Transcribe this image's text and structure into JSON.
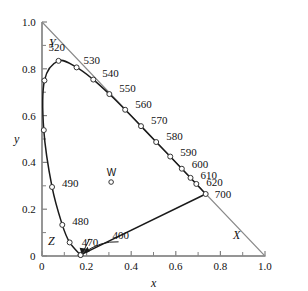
{
  "chart_data": {
    "type": "scatter",
    "title": "",
    "subtitle": "",
    "xlabel": "x",
    "ylabel": "y",
    "xlim": [
      0,
      1.0
    ],
    "ylim": [
      0,
      1.0
    ],
    "grid": false,
    "legend": null,
    "x_ticks": [
      "0",
      "0.2",
      "0.4",
      "0.6",
      "0.8",
      "1.0"
    ],
    "x_tick_values": [
      0,
      0.2,
      0.4,
      0.6,
      0.8,
      1.0
    ],
    "x_minor_tick_values": [
      0.1,
      0.3,
      0.5,
      0.7,
      0.9
    ],
    "y_ticks": [
      "0",
      "0.2",
      "0.4",
      "0.6",
      "0.8",
      "1.0"
    ],
    "y_tick_values": [
      0,
      0.2,
      0.4,
      0.6,
      0.8,
      1.0
    ],
    "y_minor_tick_values": [
      0.1,
      0.3,
      0.5,
      0.7,
      0.9
    ],
    "series": [
      {
        "name": "spectral-locus",
        "kind": "curve-with-markers",
        "points": [
          {
            "label": "400",
            "x": 0.173,
            "y": 0.005,
            "labeled": true,
            "arrow": true
          },
          {
            "label": "",
            "x": 0.173,
            "y": 0.004,
            "labeled": false
          },
          {
            "label": "470",
            "x": 0.124,
            "y": 0.058,
            "labeled": true,
            "arrow": true
          },
          {
            "label": "480",
            "x": 0.091,
            "y": 0.133,
            "labeled": true
          },
          {
            "label": "490",
            "x": 0.045,
            "y": 0.295,
            "labeled": true
          },
          {
            "label": "",
            "x": 0.008,
            "y": 0.538,
            "labeled": false
          },
          {
            "label": "",
            "x": 0.011,
            "y": 0.75,
            "labeled": false
          },
          {
            "label": "520",
            "x": 0.074,
            "y": 0.834,
            "labeled": true
          },
          {
            "label": "530",
            "x": 0.155,
            "y": 0.806,
            "labeled": true
          },
          {
            "label": "540",
            "x": 0.23,
            "y": 0.754,
            "labeled": true
          },
          {
            "label": "550",
            "x": 0.302,
            "y": 0.692,
            "labeled": true
          },
          {
            "label": "560",
            "x": 0.373,
            "y": 0.625,
            "labeled": true
          },
          {
            "label": "570",
            "x": 0.444,
            "y": 0.555,
            "labeled": true
          },
          {
            "label": "580",
            "x": 0.512,
            "y": 0.487,
            "labeled": true
          },
          {
            "label": "590",
            "x": 0.575,
            "y": 0.425,
            "labeled": true
          },
          {
            "label": "600",
            "x": 0.627,
            "y": 0.373,
            "labeled": true
          },
          {
            "label": "610",
            "x": 0.666,
            "y": 0.334,
            "labeled": true
          },
          {
            "label": "620",
            "x": 0.692,
            "y": 0.308,
            "labeled": true
          },
          {
            "label": "700",
            "x": 0.734,
            "y": 0.265,
            "labeled": true
          }
        ]
      },
      {
        "name": "purple-line",
        "kind": "line",
        "points": [
          {
            "x": 0.734,
            "y": 0.265
          },
          {
            "x": 0.173,
            "y": 0.005
          }
        ]
      },
      {
        "name": "xyz-triangle",
        "kind": "line",
        "points": [
          {
            "x": 0.0,
            "y": 1.0
          },
          {
            "x": 1.0,
            "y": 0.0
          },
          {
            "x": 0.0,
            "y": 0.0
          },
          {
            "x": 0.0,
            "y": 1.0
          }
        ]
      }
    ],
    "annotations": [
      {
        "name": "white-point",
        "label": "W",
        "x": 0.31,
        "y": 0.316,
        "marker": "open-circle"
      },
      {
        "name": "vertex-y",
        "label": "Y",
        "x": 0.0,
        "y": 1.0
      },
      {
        "name": "vertex-x",
        "label": "X",
        "x": 1.0,
        "y": 0.0
      },
      {
        "name": "vertex-z",
        "label": "Z",
        "x": 0.0,
        "y": 0.0
      }
    ]
  },
  "axes": {
    "x_title": "x",
    "y_title": "y"
  },
  "vertices": {
    "y_label": "Y",
    "x_label": "X",
    "z_label": "Z"
  },
  "white_point": {
    "label": "W"
  },
  "colors": {
    "curve": "#1a1a1a",
    "axis": "#808080",
    "triangle": "#8a8a8a",
    "marker_stroke": "#333333",
    "marker_fill": "#ffffff",
    "text": "#111111",
    "background": "#ffffff"
  }
}
